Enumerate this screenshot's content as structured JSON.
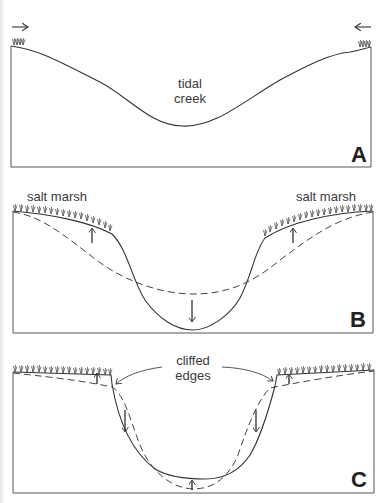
{
  "diagram": {
    "colors": {
      "line": "#3a3a3a",
      "background": "#ffffff",
      "grass": "#555555"
    },
    "panels": [
      {
        "id": "A",
        "letter": "A",
        "labels": {
          "center": [
            "tidal",
            "creek"
          ]
        },
        "annotations": [
          "inward arrow at left bank",
          "inward arrow at right bank",
          "grass tufts on bank tops"
        ],
        "profile": "solid"
      },
      {
        "id": "B",
        "letter": "B",
        "labels": {
          "left": "salt marsh",
          "right": "salt marsh"
        },
        "annotations": [
          "dashed line = previous profile",
          "upward arrows on marsh (accretion)",
          "downward arrow in channel (deepening)"
        ],
        "profile": "solid + dashed"
      },
      {
        "id": "C",
        "letter": "C",
        "labels": {
          "center": [
            "cliffed",
            "edges"
          ]
        },
        "annotations": [
          "curved arrows pointing to cliffed edges",
          "upward arrows on marsh and channel floor",
          "downward arrows on channel walls"
        ],
        "profile": "solid + dashed"
      }
    ]
  }
}
